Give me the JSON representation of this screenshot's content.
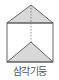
{
  "diagram": {
    "shape": "triangular-prism",
    "caption": "삼각기둥",
    "colors": {
      "stroke": "#555555",
      "fill": "#d8d8d8",
      "hidden_edge": "#777777",
      "background": "#ffffff"
    }
  }
}
